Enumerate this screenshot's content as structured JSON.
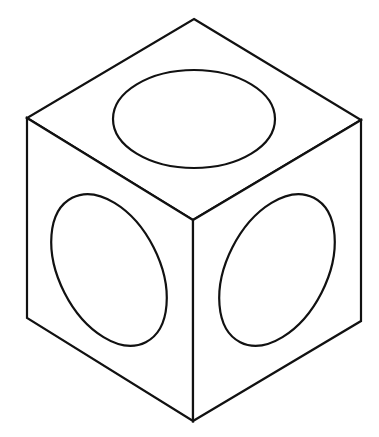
{
  "diagram": {
    "colors": {
      "stroke": "#111111",
      "background": "#ffffff"
    },
    "faces": [
      {
        "name": "top-face",
        "points": "194,19 361,120 193,220 27,118"
      },
      {
        "name": "left-face",
        "points": "27,118 193,220 193,421 27,318"
      },
      {
        "name": "right-face",
        "points": "193,220 361,120 361,321 193,421"
      }
    ],
    "circles": [
      {
        "name": "top-face-circle",
        "cx": 194,
        "cy": 119,
        "rx": 81,
        "ry": 49,
        "rotate": 0
      },
      {
        "name": "left-face-circle",
        "cx": 109,
        "cy": 270,
        "rx": 50,
        "ry": 81,
        "rotate": -27
      },
      {
        "name": "right-face-circle",
        "cx": 277,
        "cy": 270,
        "rx": 50,
        "ry": 81,
        "rotate": 27
      }
    ]
  }
}
